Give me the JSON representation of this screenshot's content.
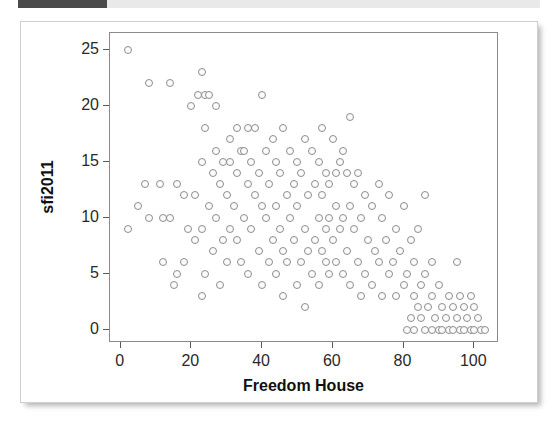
{
  "top_bar": {
    "name": "progress-bar",
    "fill_color": "#4a4a4a",
    "track_color": "#e9e9e9",
    "fill_percent": 17
  },
  "chart_data": {
    "type": "scatter",
    "title": "",
    "xlabel": "Freedom House",
    "ylabel": "sfi2011",
    "xlim": [
      -3,
      107
    ],
    "ylim": [
      -1.2,
      26.5
    ],
    "xticks": [
      0,
      20,
      40,
      60,
      80,
      100
    ],
    "yticks": [
      0,
      5,
      10,
      15,
      20,
      25
    ],
    "grid": false,
    "legend": null,
    "marker": {
      "shape": "circle-open",
      "stroke": "#8d8d8d",
      "fill": "#fbfbfb",
      "size": 8
    },
    "points": [
      [
        2,
        25
      ],
      [
        8,
        22
      ],
      [
        14,
        22
      ],
      [
        23,
        23
      ],
      [
        22,
        21
      ],
      [
        24,
        21
      ],
      [
        25,
        21
      ],
      [
        40,
        21
      ],
      [
        20,
        20
      ],
      [
        27,
        20
      ],
      [
        33,
        18
      ],
      [
        36,
        18
      ],
      [
        38,
        18
      ],
      [
        46,
        18
      ],
      [
        57,
        18
      ],
      [
        65,
        19
      ],
      [
        24,
        18
      ],
      [
        31,
        17
      ],
      [
        43,
        17
      ],
      [
        52,
        17
      ],
      [
        60,
        17
      ],
      [
        27,
        16
      ],
      [
        34,
        16
      ],
      [
        35,
        16
      ],
      [
        41,
        16
      ],
      [
        48,
        16
      ],
      [
        54,
        16
      ],
      [
        63,
        16
      ],
      [
        29,
        15
      ],
      [
        31,
        15
      ],
      [
        37,
        15
      ],
      [
        44,
        15
      ],
      [
        50,
        15
      ],
      [
        56,
        15
      ],
      [
        62,
        15
      ],
      [
        23,
        15
      ],
      [
        26,
        14
      ],
      [
        33,
        14
      ],
      [
        39,
        14
      ],
      [
        45,
        14
      ],
      [
        51,
        14
      ],
      [
        58,
        14
      ],
      [
        61,
        14
      ],
      [
        64,
        14
      ],
      [
        67,
        14
      ],
      [
        7,
        13
      ],
      [
        11,
        13
      ],
      [
        16,
        13
      ],
      [
        28,
        13
      ],
      [
        36,
        13
      ],
      [
        42,
        13
      ],
      [
        49,
        13
      ],
      [
        55,
        13
      ],
      [
        59,
        13
      ],
      [
        66,
        13
      ],
      [
        73,
        13
      ],
      [
        18,
        12
      ],
      [
        21,
        12
      ],
      [
        30,
        12
      ],
      [
        38,
        12
      ],
      [
        47,
        12
      ],
      [
        53,
        12
      ],
      [
        57,
        12
      ],
      [
        69,
        12
      ],
      [
        76,
        12
      ],
      [
        86,
        12
      ],
      [
        5,
        11
      ],
      [
        25,
        11
      ],
      [
        32,
        11
      ],
      [
        40,
        11
      ],
      [
        44,
        11
      ],
      [
        50,
        11
      ],
      [
        61,
        11
      ],
      [
        65,
        11
      ],
      [
        71,
        11
      ],
      [
        80,
        11
      ],
      [
        8,
        10
      ],
      [
        12,
        10
      ],
      [
        14,
        10
      ],
      [
        27,
        10
      ],
      [
        35,
        10
      ],
      [
        41,
        10
      ],
      [
        48,
        10
      ],
      [
        56,
        10
      ],
      [
        59,
        10
      ],
      [
        63,
        10
      ],
      [
        68,
        10
      ],
      [
        74,
        10
      ],
      [
        2,
        9
      ],
      [
        19,
        9
      ],
      [
        23,
        9
      ],
      [
        31,
        9
      ],
      [
        37,
        9
      ],
      [
        45,
        9
      ],
      [
        52,
        9
      ],
      [
        58,
        9
      ],
      [
        62,
        9
      ],
      [
        66,
        9
      ],
      [
        78,
        9
      ],
      [
        84,
        9
      ],
      [
        21,
        8
      ],
      [
        29,
        8
      ],
      [
        33,
        8
      ],
      [
        43,
        8
      ],
      [
        49,
        8
      ],
      [
        55,
        8
      ],
      [
        60,
        8
      ],
      [
        70,
        8
      ],
      [
        75,
        8
      ],
      [
        82,
        8
      ],
      [
        26,
        7
      ],
      [
        39,
        7
      ],
      [
        46,
        7
      ],
      [
        53,
        7
      ],
      [
        57,
        7
      ],
      [
        64,
        7
      ],
      [
        72,
        7
      ],
      [
        79,
        7
      ],
      [
        12,
        6
      ],
      [
        18,
        6
      ],
      [
        30,
        6
      ],
      [
        34,
        6
      ],
      [
        42,
        6
      ],
      [
        47,
        6
      ],
      [
        51,
        6
      ],
      [
        58,
        6
      ],
      [
        61,
        6
      ],
      [
        67,
        6
      ],
      [
        73,
        6
      ],
      [
        77,
        6
      ],
      [
        83,
        6
      ],
      [
        88,
        6
      ],
      [
        95,
        6
      ],
      [
        16,
        5
      ],
      [
        24,
        5
      ],
      [
        36,
        5
      ],
      [
        44,
        5
      ],
      [
        54,
        5
      ],
      [
        59,
        5
      ],
      [
        63,
        5
      ],
      [
        69,
        5
      ],
      [
        76,
        5
      ],
      [
        81,
        5
      ],
      [
        86,
        5
      ],
      [
        15,
        4
      ],
      [
        28,
        4
      ],
      [
        40,
        4
      ],
      [
        50,
        4
      ],
      [
        56,
        4
      ],
      [
        65,
        4
      ],
      [
        71,
        4
      ],
      [
        80,
        4
      ],
      [
        85,
        4
      ],
      [
        90,
        4
      ],
      [
        23,
        3
      ],
      [
        46,
        3
      ],
      [
        68,
        3
      ],
      [
        74,
        3
      ],
      [
        78,
        3
      ],
      [
        83,
        3
      ],
      [
        88,
        3
      ],
      [
        93,
        3
      ],
      [
        96,
        3
      ],
      [
        99,
        3
      ],
      [
        52,
        2
      ],
      [
        84,
        2
      ],
      [
        87,
        2
      ],
      [
        91,
        2
      ],
      [
        94,
        2
      ],
      [
        97,
        2
      ],
      [
        100,
        2
      ],
      [
        82,
        1
      ],
      [
        85,
        1
      ],
      [
        89,
        1
      ],
      [
        92,
        1
      ],
      [
        95,
        1
      ],
      [
        98,
        1
      ],
      [
        101,
        1
      ],
      [
        81,
        0
      ],
      [
        83,
        0
      ],
      [
        86,
        0
      ],
      [
        88,
        0
      ],
      [
        90,
        0
      ],
      [
        91,
        0
      ],
      [
        93,
        0
      ],
      [
        94,
        0
      ],
      [
        96,
        0
      ],
      [
        97,
        0
      ],
      [
        99,
        0
      ],
      [
        100,
        0
      ],
      [
        102,
        0
      ],
      [
        103,
        0
      ]
    ]
  }
}
